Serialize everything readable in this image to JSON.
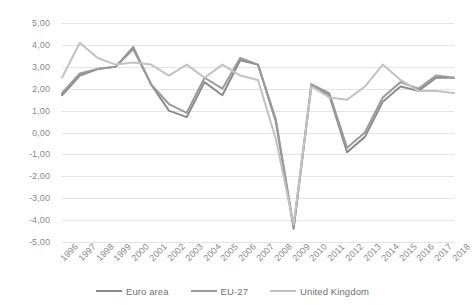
{
  "chart_data": {
    "type": "line",
    "title": "",
    "xlabel": "",
    "ylabel": "",
    "grid": true,
    "legend_position": "bottom",
    "ylim": [
      -5,
      5
    ],
    "ytick_labels": [
      "5,00",
      "4,00",
      "3,00",
      "2,00",
      "1,00",
      "0,00",
      "-1,00",
      "-2,00",
      "-3,00",
      "-4,00",
      "-5,00"
    ],
    "ytick_values": [
      5,
      4,
      3,
      2,
      1,
      0,
      -1,
      -2,
      -3,
      -4,
      -5
    ],
    "categories": [
      "1996",
      "1997",
      "1998",
      "1999",
      "2000",
      "2001",
      "2002",
      "2003",
      "2004",
      "2005",
      "2006",
      "2007",
      "2008",
      "2009",
      "2010",
      "2011",
      "2012",
      "2013",
      "2014",
      "2015",
      "2016",
      "2017",
      "2018"
    ],
    "series": [
      {
        "name": "Euro area",
        "color": "#8c8c8c",
        "values": [
          1.7,
          2.6,
          2.9,
          3.0,
          3.9,
          2.2,
          1.0,
          0.7,
          2.3,
          1.7,
          3.3,
          3.1,
          0.5,
          -4.4,
          2.2,
          1.7,
          -0.9,
          -0.2,
          1.4,
          2.1,
          1.9,
          2.5,
          2.5
        ]
      },
      {
        "name": "EU-27",
        "color": "#9a9a9a",
        "values": [
          1.8,
          2.7,
          2.9,
          3.0,
          3.8,
          2.2,
          1.3,
          0.9,
          2.5,
          2.0,
          3.4,
          3.1,
          0.6,
          -4.3,
          2.2,
          1.8,
          -0.7,
          0.0,
          1.6,
          2.3,
          2.0,
          2.6,
          2.5
        ]
      },
      {
        "name": "United Kingdom",
        "color": "#c2c2c2",
        "values": [
          2.5,
          4.1,
          3.4,
          3.1,
          3.2,
          3.1,
          2.6,
          3.1,
          2.5,
          3.1,
          2.6,
          2.4,
          -0.3,
          -4.2,
          2.1,
          1.6,
          1.5,
          2.1,
          3.1,
          2.4,
          1.9,
          1.9,
          1.8
        ]
      }
    ]
  },
  "legend": {
    "items": [
      {
        "label": "Euro area"
      },
      {
        "label": "EU-27"
      },
      {
        "label": "United Kingdom"
      }
    ]
  }
}
